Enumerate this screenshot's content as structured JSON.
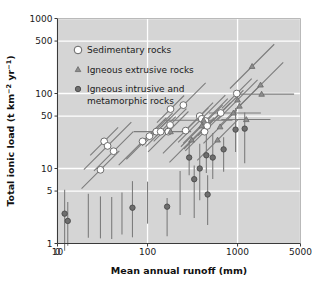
{
  "chart_data": {
    "type": "scatter",
    "title": "",
    "xlabel": "Mean annual runoff (mm)",
    "ylabel": "Total ionic load (t km−2 yr−1)",
    "ylabel_parts": {
      "prefix": "Total ionic load (t km",
      "sup1": "−2",
      "mid": " yr",
      "sup2": "−1",
      "suffix": ")"
    },
    "xscale": "log",
    "yscale": "log",
    "xlim": [
      10,
      5000
    ],
    "ylim": [
      1,
      1000
    ],
    "grid": true,
    "grid_color": "#ffffff",
    "plot_background": "#d5d5d5",
    "figure_background": "#ffffff",
    "xticks": [
      {
        "value": 0,
        "label": "0",
        "is_axis_origin": true
      },
      {
        "value": 10,
        "label": "10"
      },
      {
        "value": 100,
        "label": "100"
      },
      {
        "value": 1000,
        "label": "1000"
      },
      {
        "value": 5000,
        "label": "5000"
      }
    ],
    "yticks": [
      {
        "value": 1,
        "label": "1"
      },
      {
        "value": 5,
        "label": "5"
      },
      {
        "value": 10,
        "label": "10"
      },
      {
        "value": 50,
        "label": "50"
      },
      {
        "value": 100,
        "label": "100"
      },
      {
        "value": 500,
        "label": "500"
      },
      {
        "value": 1000,
        "label": "1000"
      }
    ],
    "legend_position": "upper-left-inside",
    "legend": [
      {
        "label": "Sedimentary rocks",
        "marker": "circle",
        "fill": "#ffffff",
        "stroke": "#555555"
      },
      {
        "label": "Igneous extrusive rocks",
        "marker": "triangle",
        "fill": "#8d8d8d",
        "stroke": "#6a6a6a"
      },
      {
        "label": "Igneous intrusive and",
        "label2": "metamorphic rocks",
        "marker": "circle",
        "fill": "#6e6e6e",
        "stroke": "#4a4a4a"
      }
    ],
    "series": [
      {
        "name": "Sedimentary rocks",
        "marker": "circle",
        "fill": "#ffffff",
        "stroke": "#606060",
        "errorbar": "diagonal",
        "points": [
          {
            "x": 30,
            "y": 9.6
          },
          {
            "x": 33,
            "y": 23
          },
          {
            "x": 36,
            "y": 20
          },
          {
            "x": 42,
            "y": 17
          },
          {
            "x": 88,
            "y": 23
          },
          {
            "x": 105,
            "y": 27
          },
          {
            "x": 125,
            "y": 31
          },
          {
            "x": 140,
            "y": 31
          },
          {
            "x": 170,
            "y": 31
          },
          {
            "x": 178,
            "y": 38
          },
          {
            "x": 180,
            "y": 62
          },
          {
            "x": 250,
            "y": 70
          },
          {
            "x": 265,
            "y": 32
          },
          {
            "x": 380,
            "y": 50
          },
          {
            "x": 400,
            "y": 46
          },
          {
            "x": 430,
            "y": 31
          },
          {
            "x": 440,
            "y": 43
          },
          {
            "x": 460,
            "y": 37
          },
          {
            "x": 650,
            "y": 55
          },
          {
            "x": 980,
            "y": 100
          }
        ]
      },
      {
        "name": "Igneous extrusive rocks",
        "marker": "triangle",
        "fill": "#8d8d8d",
        "stroke": "#6a6a6a",
        "errorbar": "mixed",
        "points": [
          {
            "x": 180,
            "y": 31
          },
          {
            "x": 310,
            "y": 24
          },
          {
            "x": 400,
            "y": 37
          },
          {
            "x": 420,
            "y": 44
          },
          {
            "x": 600,
            "y": 24
          },
          {
            "x": 640,
            "y": 36
          },
          {
            "x": 900,
            "y": 55
          },
          {
            "x": 1000,
            "y": 82
          },
          {
            "x": 1050,
            "y": 68
          },
          {
            "x": 1250,
            "y": 45
          },
          {
            "x": 1450,
            "y": 230
          },
          {
            "x": 1800,
            "y": 130
          },
          {
            "x": 1850,
            "y": 98
          }
        ]
      },
      {
        "name": "Igneous intrusive and metamorphic rocks",
        "marker": "circle",
        "fill": "#6e6e6e",
        "stroke": "#4a4a4a",
        "errorbar": "vertical",
        "points": [
          {
            "x": 12,
            "y": 2.5
          },
          {
            "x": 13,
            "y": 2.0
          },
          {
            "x": 68,
            "y": 3.0
          },
          {
            "x": 165,
            "y": 3.1
          },
          {
            "x": 290,
            "y": 14
          },
          {
            "x": 330,
            "y": 7.2
          },
          {
            "x": 380,
            "y": 10
          },
          {
            "x": 450,
            "y": 15
          },
          {
            "x": 465,
            "y": 4.5
          },
          {
            "x": 530,
            "y": 14
          },
          {
            "x": 700,
            "y": 18
          },
          {
            "x": 950,
            "y": 33
          },
          {
            "x": 1200,
            "y": 34
          }
        ]
      }
    ]
  }
}
